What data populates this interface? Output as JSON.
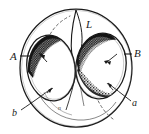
{
  "figure": {
    "kind": "hand-drawn-anatomical-sketch",
    "background_color": "#ffffff",
    "ink_color": "#1a1a1a",
    "stipple_color": "#2b2b2b",
    "width": 149,
    "height": 134
  },
  "labels": {
    "left_capital": "A",
    "right_capital": "B",
    "top_capital": "L",
    "bottom_left_lower": "b",
    "bottom_right_lower": "a",
    "bottom_center_mark": "n"
  },
  "parts": {
    "outer_oval": "outer-oval",
    "left_ellipse": "left-ellipse",
    "right_ellipse": "right-ellipse",
    "left_dark_crescent": "left-dark-crescent",
    "right_upper_dark_crescent": "right-upper-dark-crescent",
    "right_lower_dark_crescent": "right-lower-dark-crescent",
    "dashed_arc_upper_left": "dashed-arc-upper-left",
    "dashed_arc_lower_right": "dashed-arc-lower-right"
  },
  "leaders": {
    "a_leader": "leader-line-A",
    "b_leader": "leader-line-B",
    "lower_a_leader": "leader-line-lower-a",
    "lower_b_leader": "leader-line-lower-b"
  }
}
